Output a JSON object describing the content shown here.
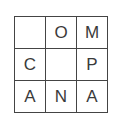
{
  "puzzle": {
    "rows": [
      [
        "",
        "O",
        "M"
      ],
      [
        "C",
        "",
        "P"
      ],
      [
        "A",
        "N",
        "A"
      ]
    ]
  }
}
